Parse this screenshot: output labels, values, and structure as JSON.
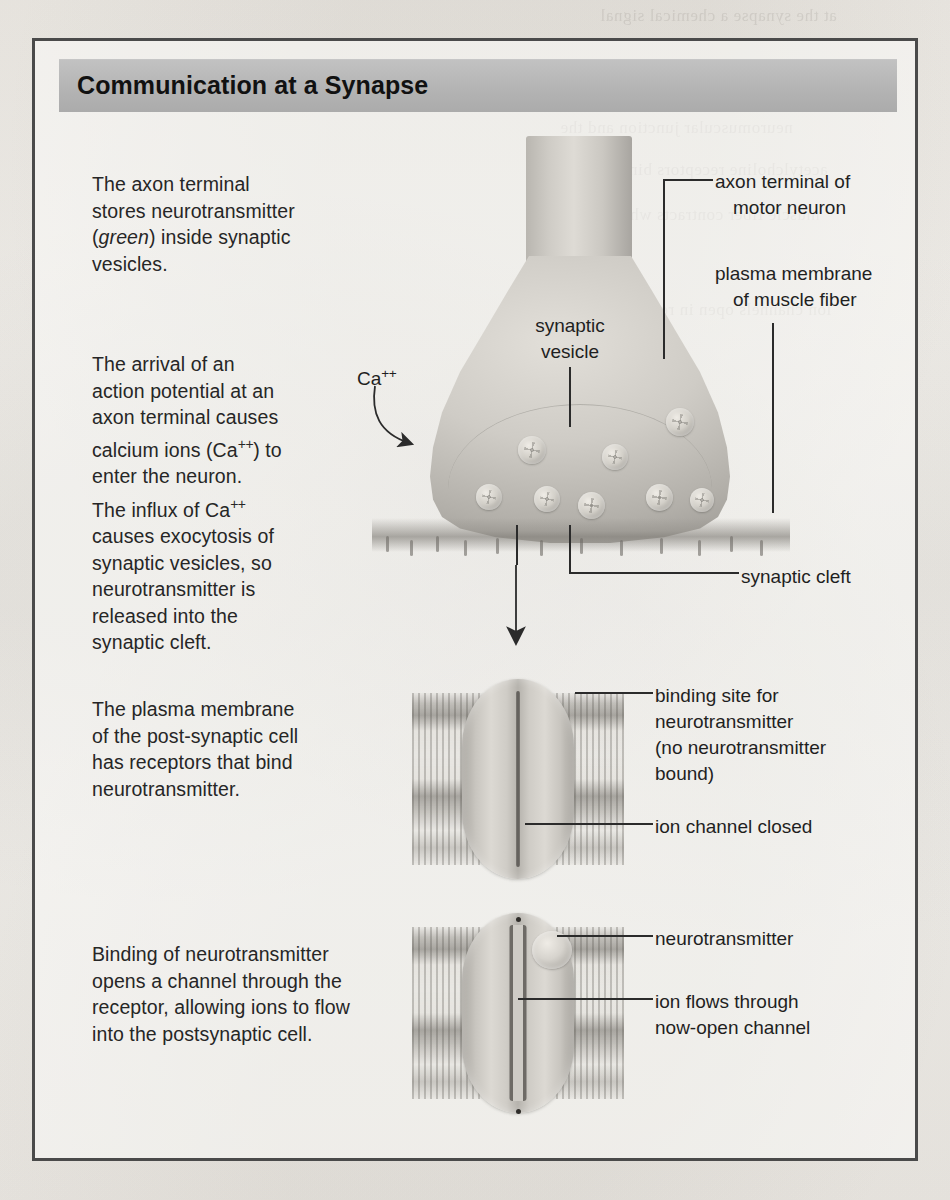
{
  "figure": {
    "title": "Communication at a Synapse",
    "left_steps": [
      {
        "id": "step-stores",
        "lines": [
          "The axon terminal",
          "stores neurotransmitter",
          "(green) inside synaptic",
          "vesicles."
        ],
        "italic_word": "green",
        "text": "The axon terminal stores neurotransmitter (green) inside synaptic vesicles."
      },
      {
        "id": "step-action-potential",
        "lines": [
          "The arrival of an",
          "action potential at an",
          "axon terminal causes",
          "calcium ions (Ca++) to",
          "enter the neuron."
        ],
        "text": "The arrival of an action potential at an axon terminal causes calcium ions (Ca++) to enter the neuron."
      },
      {
        "id": "step-exocytosis",
        "lines": [
          "The influx of Ca++",
          "causes exocytosis of",
          "synaptic vesicles, so",
          "neurotransmitter is",
          "released into the",
          "synaptic cleft."
        ],
        "text": "The influx of Ca++ causes exocytosis of synaptic vesicles, so neurotransmitter is released into the synaptic cleft."
      },
      {
        "id": "step-receptors",
        "lines": [
          "The plasma membrane",
          "of the post-synaptic cell",
          "has receptors that bind",
          "neurotransmitter."
        ],
        "text": "The plasma membrane of the post-synaptic cell has receptors that bind neurotransmitter."
      },
      {
        "id": "step-channel-opens",
        "lines": [
          "Binding of neurotransmitter",
          "opens a channel through the",
          "receptor, allowing ions to flow",
          "into the postsynaptic cell."
        ],
        "text": "Binding of neurotransmitter opens a channel through the receptor, allowing ions to flow into the postsynaptic cell."
      }
    ],
    "callouts": {
      "ca_ion": "Ca++",
      "synaptic_vesicle": [
        "synaptic",
        "vesicle"
      ],
      "axon_terminal": [
        "axon terminal of",
        "motor neuron"
      ],
      "plasma_membrane": [
        "plasma membrane",
        "of muscle fiber"
      ],
      "synaptic_cleft": "synaptic cleft",
      "binding_site": [
        "binding site for",
        "neurotransmitter",
        "(no neurotransmitter",
        "bound)"
      ],
      "ion_channel_closed": "ion channel closed",
      "neurotransmitter": "neurotransmitter",
      "ion_flows": [
        "ion flows through",
        "now-open channel"
      ]
    }
  },
  "colors": {
    "frame_border": "#4a4a4a",
    "title_bar": "#b8b8b8",
    "page_background": "#f2f0ec",
    "text": "#262626",
    "leader_line": "#2b2b2b"
  },
  "bleed_text": [
    "at the synapse a chemical signal",
    "neuromuscular junction and the",
    "acetylcholine receptors bind to",
    "muscle fiber contracts when the",
    "ion channels open in response"
  ]
}
